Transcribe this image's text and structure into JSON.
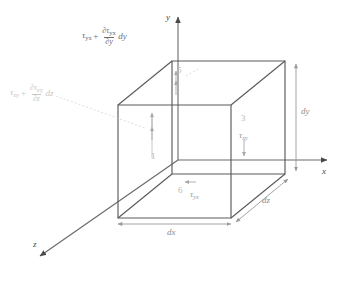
{
  "figure": {
    "type": "stress-element-diagram",
    "axes": [
      {
        "name": "y-axis",
        "label": "y",
        "direction": "up"
      },
      {
        "name": "x-axis",
        "label": "x",
        "direction": "right"
      },
      {
        "name": "z-axis",
        "label": "z",
        "direction": "down-left"
      }
    ],
    "dimensions": [
      {
        "name": "dx",
        "label": "dx",
        "edge": "front-bottom-horizontal"
      },
      {
        "name": "dy",
        "label": "dy",
        "edge": "right-vertical"
      },
      {
        "name": "dz",
        "label": "dz",
        "edge": "bottom-right-diagonal"
      }
    ],
    "faces": [
      {
        "number": "1",
        "name": "face-1",
        "stress": "",
        "arrow": "up"
      },
      {
        "number": "3",
        "name": "face-3",
        "stress": "τ",
        "subscript": "xy",
        "arrow": "down"
      },
      {
        "number": "5",
        "name": "face-5",
        "stress": "",
        "arrow": "up"
      },
      {
        "number": "6",
        "name": "face-6",
        "stress": "τ",
        "subscript": "yx",
        "arrow": "left"
      }
    ],
    "equations": [
      {
        "name": "tau-yx-increment",
        "base": "τ",
        "base_sub": "yx",
        "operator": "+",
        "numerator_sym": "∂τ",
        "numerator_sub": "yx",
        "denominator_sym": "∂y",
        "differential": "dy",
        "position": "top-left"
      },
      {
        "name": "tau-zy-increment",
        "base": "τ",
        "base_sub": "zy",
        "operator": "+",
        "numerator_sym": "∂τ",
        "numerator_sub": "zy",
        "denominator_sym": "∂z",
        "differential": "dz",
        "position": "left"
      }
    ],
    "colors": {
      "cube_edge": "#5a5a5a",
      "axis": "#6b6b6b",
      "dimension": "#9a9a9a",
      "stress_arrow": "#a8a8a8",
      "faint_text": "#c8c8c8",
      "background": "#ffffff"
    }
  }
}
